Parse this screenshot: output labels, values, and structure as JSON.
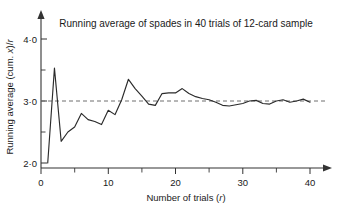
{
  "chart_data": {
    "type": "line",
    "title": "Running average of spades in 40 trials of 12-card sample",
    "xlabel": "Number of trials (r)",
    "ylabel": "Running average (cum. x)/r",
    "xlim": [
      0,
      43
    ],
    "ylim": [
      2.0,
      4.2
    ],
    "grid": false,
    "legend": null,
    "x_ticks": [
      0,
      10,
      20,
      30,
      40
    ],
    "x_tick_labels": [
      "0",
      "10",
      "20",
      "30",
      "40"
    ],
    "x_minor_ticks": [
      5,
      15,
      25,
      35
    ],
    "y_ticks": [
      2.0,
      3.0,
      4.0
    ],
    "y_tick_labels": [
      "2·0",
      "3·0",
      "4·0"
    ],
    "y_minor_ticks": [
      2.5,
      3.5
    ],
    "annotations": [
      {
        "type": "hline",
        "y": 3.0,
        "style": "dashed",
        "color": "#6e6e6e",
        "label": "expected value 3·0"
      }
    ],
    "series": [
      {
        "name": "Running average (cum. x)/r",
        "color": "#2b2b2b",
        "x": [
          1,
          2,
          3,
          4,
          5,
          6,
          7,
          8,
          9,
          10,
          11,
          12,
          13,
          14,
          15,
          16,
          17,
          18,
          19,
          20,
          21,
          22,
          23,
          24,
          25,
          26,
          27,
          28,
          29,
          30,
          31,
          32,
          33,
          34,
          35,
          36,
          37,
          38,
          39,
          40
        ],
        "values": [
          2.0,
          3.53,
          2.35,
          2.5,
          2.58,
          2.8,
          2.7,
          2.67,
          2.62,
          2.85,
          2.78,
          3.02,
          3.35,
          3.2,
          3.08,
          2.95,
          2.93,
          3.12,
          3.13,
          3.13,
          3.2,
          3.12,
          3.07,
          3.04,
          3.02,
          2.98,
          2.93,
          2.92,
          2.94,
          2.96,
          3.0,
          3.01,
          2.96,
          2.95,
          3.0,
          3.02,
          2.98,
          3.0,
          3.03,
          2.98
        ]
      }
    ]
  },
  "figure": {
    "caption_title": "Running average of spades in 40 trials of 12-card sample",
    "axis_x_title": "Number of trials (",
    "axis_x_var": "r",
    "axis_x_title_end": ")",
    "axis_y_title_a": "Running average (cum. ",
    "axis_y_var": "x",
    "axis_y_title_b": ")/",
    "axis_y_var2": "r"
  }
}
